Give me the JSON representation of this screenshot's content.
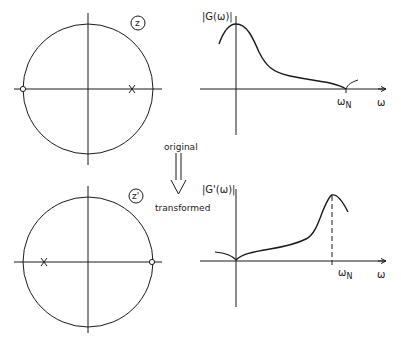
{
  "top": {
    "plane_label": "z",
    "magnitude_label": "|G(ω)|",
    "freq_marker": "ω",
    "freq_marker_sub": "N",
    "axis_label": "ω",
    "pole": {
      "position": "right, inside unit circle",
      "symbol": "x"
    },
    "zero": {
      "position": "left, on unit circle",
      "symbol": "o"
    }
  },
  "arrow": {
    "top_label": "original",
    "bottom_label": "transformed"
  },
  "bottom": {
    "plane_label": "z'",
    "magnitude_label": "|G'(ω)|",
    "freq_marker": "ω",
    "freq_marker_sub": "N",
    "axis_label": "ω",
    "pole": {
      "position": "left, inside unit circle",
      "symbol": "x"
    },
    "zero": {
      "position": "right, on unit circle",
      "symbol": "o"
    }
  },
  "colors": {
    "ink": "#1a1a1a",
    "background": "#ffffff"
  }
}
